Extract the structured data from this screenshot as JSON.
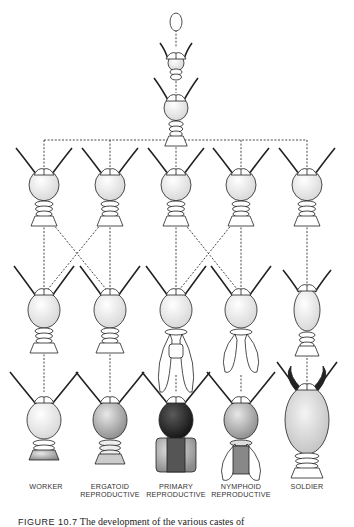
{
  "figure": {
    "type": "caste-development-diagram",
    "caption_label": "FIGURE 10.7",
    "caption_text": "The development of the various castes of"
  },
  "stages": {
    "top": [
      {
        "id": "egg",
        "x": 176,
        "y": 22,
        "kind": "egg"
      },
      {
        "id": "larva-1",
        "x": 176,
        "y": 63,
        "kind": "larva-small"
      },
      {
        "id": "larva-2",
        "x": 176,
        "y": 108,
        "kind": "larva"
      }
    ],
    "row1": [
      {
        "id": "r1c1",
        "x": 44,
        "y": 185,
        "kind": "larva"
      },
      {
        "id": "r1c2",
        "x": 110,
        "y": 185,
        "kind": "larva"
      },
      {
        "id": "r1c3",
        "x": 176,
        "y": 185,
        "kind": "larva"
      },
      {
        "id": "r1c4",
        "x": 241,
        "y": 185,
        "kind": "larva"
      },
      {
        "id": "r1c5",
        "x": 307,
        "y": 185,
        "kind": "larva-presoldier"
      }
    ],
    "row2": [
      {
        "id": "r2c1",
        "x": 44,
        "y": 310,
        "kind": "pseudergate"
      },
      {
        "id": "r2c2",
        "x": 110,
        "y": 310,
        "kind": "pseudergate"
      },
      {
        "id": "r2c3",
        "x": 176,
        "y": 310,
        "kind": "nymph-long-wings"
      },
      {
        "id": "r2c4",
        "x": 241,
        "y": 310,
        "kind": "nymph-short-wings"
      },
      {
        "id": "r2c5",
        "x": 307,
        "y": 310,
        "kind": "presoldier"
      }
    ],
    "row3": [
      {
        "id": "worker",
        "x": 44,
        "y": 420,
        "kind": "worker"
      },
      {
        "id": "ergatoid",
        "x": 110,
        "y": 420,
        "kind": "ergatoid"
      },
      {
        "id": "primary",
        "x": 176,
        "y": 420,
        "kind": "primary"
      },
      {
        "id": "nymphoid",
        "x": 241,
        "y": 420,
        "kind": "nymphoid"
      },
      {
        "id": "soldier",
        "x": 307,
        "y": 420,
        "kind": "soldier"
      }
    ]
  },
  "labels": [
    {
      "line1": "WORKER",
      "line2": "",
      "x": 46
    },
    {
      "line1": "ERGATOID",
      "line2": "REPRODUCTIVE",
      "x": 110
    },
    {
      "line1": "PRIMARY",
      "line2": "REPRODUCTIVE",
      "x": 176
    },
    {
      "line1": "NYMPHOID",
      "line2": "REPRODUCTIVE",
      "x": 241
    },
    {
      "line1": "SOLDIER",
      "line2": "",
      "x": 307
    }
  ],
  "connections": {
    "style": "dashed",
    "trunk": {
      "x": 176,
      "y1": 140
    },
    "bus_y": 140,
    "vertical": [
      [
        "top",
        "row1",
        0
      ],
      [
        "row1",
        "row2",
        "straight"
      ],
      [
        "row2",
        "row3",
        "straight"
      ]
    ],
    "crossings": [
      {
        "from": "r1c1",
        "to": "r2c2"
      },
      {
        "from": "r1c2",
        "to": "r2c1"
      },
      {
        "from": "r1c3",
        "to": "r2c4"
      },
      {
        "from": "r1c4",
        "to": "r2c3"
      }
    ]
  },
  "colors": {
    "ink": "#222222",
    "shade_light": "#d9d9d9",
    "shade_mid": "#9a9a9a",
    "shade_dark": "#2a2a2a",
    "paper": "#ffffff"
  }
}
